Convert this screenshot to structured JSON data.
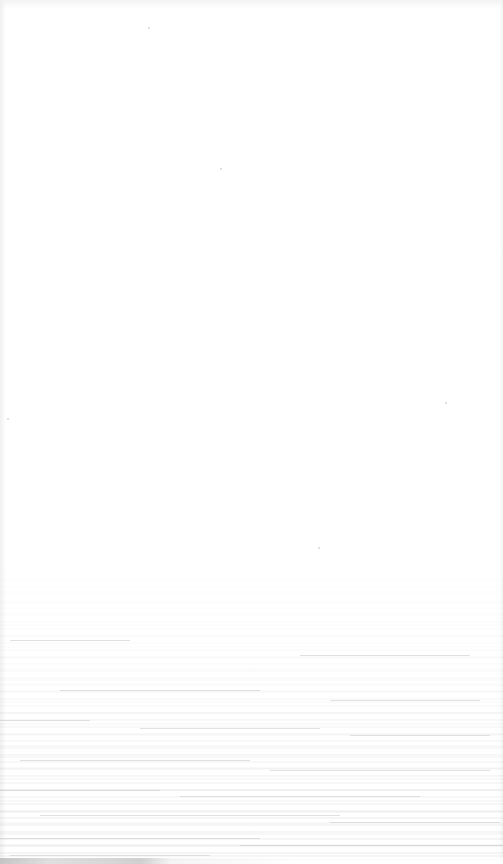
{
  "image": {
    "description": "Overexposed, nearly white photograph with faint horizontal grain texture concentrated toward the bottom",
    "background_color": "#ffffff",
    "texture_color": "#c9c9c9",
    "edge_shadow_color": "#b8b8b8",
    "texture_region": {
      "top": 560,
      "bottom": 864
    },
    "streaks": [
      {
        "x": 10,
        "y": 640,
        "w": 120
      },
      {
        "x": 300,
        "y": 655,
        "w": 170
      },
      {
        "x": 60,
        "y": 690,
        "w": 200
      },
      {
        "x": 330,
        "y": 700,
        "w": 150
      },
      {
        "x": 0,
        "y": 720,
        "w": 90
      },
      {
        "x": 140,
        "y": 728,
        "w": 180
      },
      {
        "x": 350,
        "y": 735,
        "w": 140
      },
      {
        "x": 20,
        "y": 760,
        "w": 230
      },
      {
        "x": 270,
        "y": 770,
        "w": 220
      },
      {
        "x": 0,
        "y": 790,
        "w": 160
      },
      {
        "x": 180,
        "y": 796,
        "w": 240
      },
      {
        "x": 40,
        "y": 815,
        "w": 300
      },
      {
        "x": 330,
        "y": 822,
        "w": 170
      },
      {
        "x": 0,
        "y": 838,
        "w": 260
      },
      {
        "x": 240,
        "y": 845,
        "w": 263
      },
      {
        "x": 10,
        "y": 855,
        "w": 200
      }
    ],
    "specks": [
      {
        "x": 148,
        "y": 27
      },
      {
        "x": 7,
        "y": 418
      },
      {
        "x": 445,
        "y": 402
      },
      {
        "x": 318,
        "y": 547
      },
      {
        "x": 220,
        "y": 168
      }
    ]
  }
}
